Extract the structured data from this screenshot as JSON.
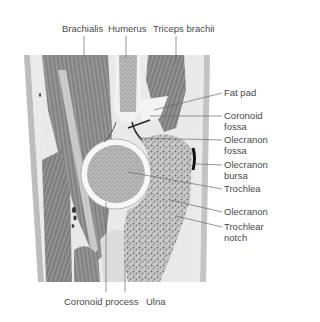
{
  "figure": {
    "labels_top": [
      {
        "id": "brachialis",
        "text": "Brachialis",
        "x": 62,
        "y": 23
      },
      {
        "id": "humerus",
        "text": "Humerus",
        "x": 108,
        "y": 23
      },
      {
        "id": "triceps",
        "text": "Triceps brachii",
        "x": 153,
        "y": 23
      }
    ],
    "labels_right": [
      {
        "id": "fat-pad",
        "lines": [
          "Fat pad"
        ],
        "x": 224,
        "y": 87
      },
      {
        "id": "coronoid-fossa",
        "lines": [
          "Coronoid",
          "fossa"
        ],
        "x": 224,
        "y": 112
      },
      {
        "id": "olecranon-fossa",
        "lines": [
          "Olecranon",
          "fossa"
        ],
        "x": 224,
        "y": 137
      },
      {
        "id": "olecranon-bursa",
        "lines": [
          "Olecranon",
          "bursa"
        ],
        "x": 224,
        "y": 161
      },
      {
        "id": "trochlea",
        "lines": [
          "Trochlea"
        ],
        "x": 224,
        "y": 185
      },
      {
        "id": "olecranon",
        "lines": [
          "Olecranon"
        ],
        "x": 224,
        "y": 208
      },
      {
        "id": "trochlear-notch",
        "lines": [
          "Trochlear",
          "notch"
        ],
        "x": 224,
        "y": 224
      }
    ],
    "labels_bottom": [
      {
        "id": "coronoid-process",
        "text": "Coronoid process",
        "x": 24,
        "y": 298
      },
      {
        "id": "ulna",
        "text": "Ulna",
        "x": 106,
        "y": 298
      }
    ],
    "colors": {
      "text": "#4a4a4a",
      "leader": "#6a6a6a",
      "muscle": "#8e8e8e",
      "muscle_dark": "#6e6e6e",
      "bone": "#a9a9a9",
      "cartilage": "#f4f4f4",
      "fat": "#e6e6e6",
      "skin": "#bdbdbd"
    }
  }
}
